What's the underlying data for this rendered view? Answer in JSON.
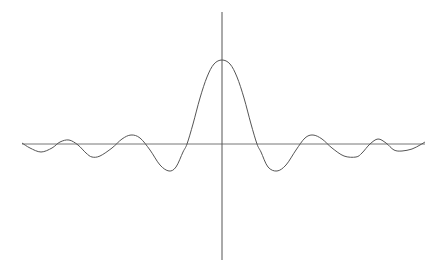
{
  "chart_data": {
    "type": "line",
    "title": "",
    "xlabel": "",
    "ylabel": "",
    "grid": false,
    "legend": null,
    "series": [
      {
        "name": "curve",
        "color": "#555555",
        "points_px": [
          [
            22,
            143
          ],
          [
            30,
            148
          ],
          [
            41,
            152
          ],
          [
            52,
            148
          ],
          [
            60,
            142
          ],
          [
            69,
            140
          ],
          [
            78,
            145
          ],
          [
            86,
            153
          ],
          [
            92,
            157
          ],
          [
            100,
            156
          ],
          [
            112,
            148
          ],
          [
            122,
            139
          ],
          [
            131,
            135
          ],
          [
            140,
            138
          ],
          [
            150,
            150
          ],
          [
            160,
            165
          ],
          [
            169,
            171
          ],
          [
            176,
            167
          ],
          [
            183,
            152
          ],
          [
            187,
            144
          ],
          [
            193,
            124
          ],
          [
            200,
            98
          ],
          [
            207,
            77
          ],
          [
            214,
            64
          ],
          [
            222,
            60
          ],
          [
            230,
            64
          ],
          [
            237,
            77
          ],
          [
            244,
            98
          ],
          [
            251,
            124
          ],
          [
            257,
            144
          ],
          [
            261,
            152
          ],
          [
            268,
            167
          ],
          [
            277,
            171
          ],
          [
            286,
            165
          ],
          [
            296,
            150
          ],
          [
            305,
            138
          ],
          [
            313,
            135
          ],
          [
            322,
            139
          ],
          [
            332,
            148
          ],
          [
            344,
            156
          ],
          [
            356,
            157
          ],
          [
            362,
            153
          ],
          [
            370,
            144
          ],
          [
            378,
            139
          ],
          [
            386,
            143
          ],
          [
            394,
            150
          ],
          [
            402,
            151
          ],
          [
            412,
            149
          ],
          [
            420,
            145
          ],
          [
            425,
            142
          ]
        ]
      }
    ],
    "axes": {
      "x_axis": {
        "y": 144,
        "x_from": 22,
        "x_to": 425,
        "color": "#777777"
      },
      "y_axis": {
        "x": 222,
        "y_from": 12,
        "y_to": 260,
        "color": "#555555"
      }
    }
  }
}
